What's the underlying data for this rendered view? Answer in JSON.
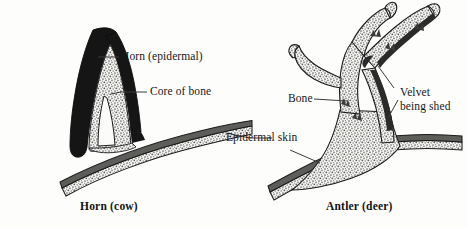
{
  "figure": {
    "background_color": "#fdfdfc",
    "ink_color": "#17171a"
  },
  "panels": [
    {
      "id": "horn-cow",
      "caption": "Horn (cow)",
      "animal": "cow",
      "structure": "horn",
      "labels": [
        {
          "id": "horn-epidermal",
          "text": "Horn (epidermal)",
          "points_to": "black outer keratin sheath",
          "fill": "#1a1a1a"
        },
        {
          "id": "core-of-bone",
          "text": "Core of bone",
          "points_to": "stippled bony core inside sheath",
          "fill": "#b9b9b6"
        }
      ]
    },
    {
      "id": "antler-deer",
      "caption": "Antler (deer)",
      "animal": "deer",
      "structure": "antler",
      "labels": [
        {
          "id": "bone",
          "text": "Bone",
          "points_to": "stippled branching antler trunk",
          "fill": "#b9b9b6"
        },
        {
          "id": "velvet-being-shed",
          "text_line1": "Velvet",
          "text_line2": "being shed",
          "text": "Velvet being shed",
          "points_to": "dark ragged skin peeling from upper tine",
          "fill": "#2a2a2a"
        }
      ]
    }
  ],
  "shared_labels": [
    {
      "id": "epidermal-skin",
      "text": "Epidermal skin",
      "points_to": "layered skin band at base of both structures",
      "fill": "#6e6e6b"
    }
  ],
  "legend_keys": {
    "black_sheath": "#1a1a1a",
    "stipple_bone": "#b8b8b5",
    "skin_dark_band": "#5d5d5a",
    "outline": "#1c1c1e"
  }
}
